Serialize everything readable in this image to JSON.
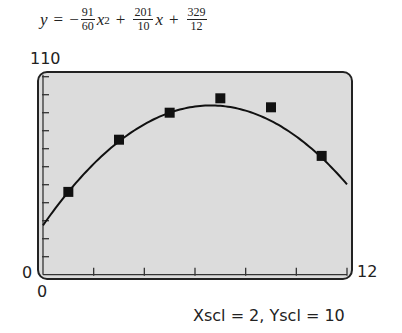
{
  "equation": {
    "lhs": "y",
    "eq": "=",
    "sign": "−",
    "a_num": "91",
    "a_den": "60",
    "var_x2": "x",
    "exp": "2",
    "plus1": "+",
    "b_num": "201",
    "b_den": "10",
    "var_x": "x",
    "plus2": "+",
    "c_num": "329",
    "c_den": "12"
  },
  "window": {
    "ymax_label": "110",
    "ymin_label": "0",
    "xmin_label": "0",
    "xmax_label": "12",
    "scale_label": "Xscl = 2, Yscl = 10"
  },
  "colors": {
    "screen_bg": "#dcdcdc",
    "frame": "#222222",
    "curve": "#111111",
    "marker": "#111111"
  },
  "chart_data": {
    "type": "scatter",
    "xlabel": "",
    "ylabel": "",
    "xlim": [
      0,
      12
    ],
    "ylim": [
      0,
      110
    ],
    "xscl": 2,
    "yscl": 10,
    "grid": false,
    "series": [
      {
        "name": "data",
        "type": "scatter",
        "marker": "square",
        "x": [
          1,
          3,
          5,
          7,
          9,
          11
        ],
        "y": [
          46,
          75,
          90,
          98,
          93,
          66
        ]
      },
      {
        "name": "quadratic regression",
        "type": "line",
        "coefficients": {
          "a": -1.5166667,
          "b": 20.1,
          "c": 27.4166667
        },
        "equation": "y = -91/60 x^2 + 201/10 x + 329/12"
      }
    ]
  }
}
